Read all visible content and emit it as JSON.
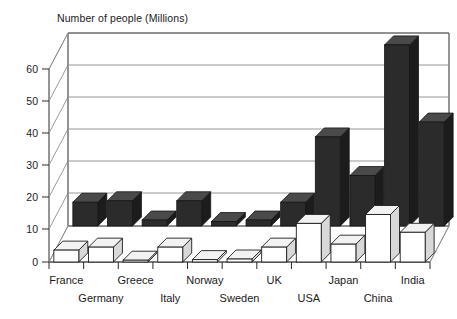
{
  "chart_data": {
    "type": "bar",
    "title": "Number of people (Millions)",
    "subtitle": "",
    "xlabel": "",
    "ylabel": "Number of people (Millions)",
    "ylim": [
      0,
      65
    ],
    "yticks": [
      0,
      10,
      20,
      30,
      40,
      50,
      60
    ],
    "ytick_labels": [
      "0",
      "10",
      "20",
      "30",
      "40",
      "50",
      "60"
    ],
    "grid": true,
    "legend": "none",
    "style": "3d-perspective",
    "categories": [
      "France",
      "Germany",
      "Greece",
      "Italy",
      "Norway",
      "Sweden",
      "UK",
      "USA",
      "Japan",
      "China",
      "India"
    ],
    "series": [
      {
        "name": "back-series",
        "color": "#2b2b2b",
        "values": [
          8,
          8.5,
          2,
          8.5,
          1.5,
          2,
          8,
          30,
          17,
          61,
          35
        ]
      },
      {
        "name": "front-series",
        "color": "#ffffff",
        "values": [
          4,
          5,
          0.6,
          5,
          0.8,
          1,
          5,
          13,
          6,
          16,
          10
        ]
      }
    ]
  },
  "axes": {
    "title": "Number of people (Millions)",
    "y_tick_labels": [
      "60",
      "50",
      "40",
      "30",
      "20",
      "10",
      "0"
    ],
    "x_tick_labels_row_top": [
      "France",
      "Greece",
      "Norway",
      "UK",
      "USA",
      "China"
    ],
    "x_tick_labels_row_bottom": [
      "Germany",
      "Italy",
      "Sweden",
      "Japan",
      "India"
    ]
  },
  "colors": {
    "background": "#ffffff",
    "ink": "#1a1a1a",
    "grid": "#8d8d8d",
    "bar_dark": "#2b2b2b",
    "bar_light": "#ffffff"
  }
}
